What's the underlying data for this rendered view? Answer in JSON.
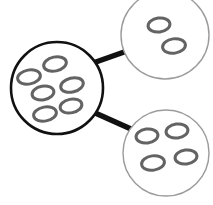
{
  "diagram": {
    "background_color": "#ffffff",
    "nodes": [
      {
        "id": "parent-cell",
        "label": "parent-cell",
        "role": "parent",
        "cx": 57,
        "cy": 88,
        "r": 46,
        "stroke_color": "#111111",
        "stroke_width": 2.6,
        "fill_color": "#ffffff",
        "organelle_count": 6,
        "organelles": [
          {
            "cx": 55,
            "cy": 64,
            "rx": 11.5,
            "ry": 7.0,
            "rot": -12
          },
          {
            "cx": 29,
            "cy": 77,
            "rx": 11.5,
            "ry": 7.0,
            "rot": -10
          },
          {
            "cx": 72,
            "cy": 85,
            "rx": 11.5,
            "ry": 7.0,
            "rot": -14
          },
          {
            "cx": 43,
            "cy": 93,
            "rx": 11.0,
            "ry": 6.8,
            "rot": -10
          },
          {
            "cx": 71,
            "cy": 106,
            "rx": 11.0,
            "ry": 6.8,
            "rot": -12
          },
          {
            "cx": 45,
            "cy": 114,
            "rx": 11.5,
            "ry": 7.0,
            "rot": -10
          }
        ]
      },
      {
        "id": "daughter-cell-top",
        "label": "daughter-cell-top",
        "role": "daughter",
        "cx": 165,
        "cy": 35,
        "r": 44,
        "stroke_color": "#9b9b9b",
        "stroke_width": 1.4,
        "fill_color": "#ffffff",
        "organelle_count": 2,
        "organelles": [
          {
            "cx": 159,
            "cy": 25,
            "rx": 11.0,
            "ry": 7.0,
            "rot": -8
          },
          {
            "cx": 174,
            "cy": 46,
            "rx": 11.5,
            "ry": 7.2,
            "rot": -8
          }
        ]
      },
      {
        "id": "daughter-cell-bottom",
        "label": "daughter-cell-bottom",
        "role": "daughter",
        "cx": 166,
        "cy": 153,
        "r": 43,
        "stroke_color": "#9b9b9b",
        "stroke_width": 1.4,
        "fill_color": "#ffffff",
        "organelle_count": 4,
        "organelles": [
          {
            "cx": 147,
            "cy": 136,
            "rx": 11.0,
            "ry": 7.0,
            "rot": -8
          },
          {
            "cx": 177,
            "cy": 131,
            "rx": 11.0,
            "ry": 7.0,
            "rot": -8
          },
          {
            "cx": 153,
            "cy": 163,
            "rx": 11.5,
            "ry": 7.2,
            "rot": -8
          },
          {
            "cx": 186,
            "cy": 157,
            "rx": 11.0,
            "ry": 7.0,
            "rot": -8
          }
        ]
      }
    ],
    "connectors": [
      {
        "id": "connector-top",
        "label": "connector-parent-to-top-daughter",
        "from": "parent-cell",
        "to": "daughter-cell-top",
        "x1": 93,
        "y1": 63,
        "x2": 127,
        "y2": 51,
        "color": "#111111",
        "width": 5.5
      },
      {
        "id": "connector-bottom",
        "label": "connector-parent-to-bottom-daughter",
        "from": "parent-cell",
        "to": "daughter-cell-bottom",
        "x1": 93,
        "y1": 112,
        "x2": 131,
        "y2": 129,
        "color": "#111111",
        "width": 5.5
      }
    ],
    "organelle_style": {
      "stroke_color": "#636363",
      "stroke_width": 3.0,
      "fill_color": "#ffffff"
    }
  }
}
